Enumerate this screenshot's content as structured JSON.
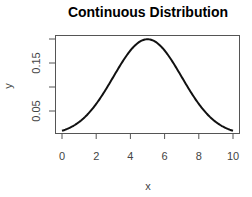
{
  "chart_data": {
    "type": "line",
    "title": "Continuous Distribution",
    "xlabel": "x",
    "ylabel": "y",
    "xlim": [
      0,
      10
    ],
    "ylim": [
      0.0,
      0.2
    ],
    "x_ticks": [
      0,
      2,
      4,
      6,
      8,
      10
    ],
    "x_tick_labels": [
      "0",
      "2",
      "4",
      "6",
      "8",
      "10"
    ],
    "y_ticks": [
      0.05,
      0.1,
      0.15,
      0.2
    ],
    "y_tick_labels": [
      "0.05",
      "",
      "0.15",
      ""
    ],
    "grid": false,
    "legend": null,
    "series": [
      {
        "name": "density",
        "x": [
          0,
          0.5,
          1,
          1.5,
          2,
          2.5,
          3,
          3.5,
          4,
          4.5,
          5,
          5.5,
          6,
          6.5,
          7,
          7.5,
          8,
          8.5,
          9,
          9.5,
          10
        ],
        "y": [
          0.0088,
          0.0158,
          0.027,
          0.0431,
          0.0648,
          0.0913,
          0.121,
          0.1506,
          0.176,
          0.1934,
          0.1995,
          0.1934,
          0.176,
          0.1506,
          0.121,
          0.0913,
          0.0648,
          0.0431,
          0.027,
          0.0158,
          0.0088
        ]
      }
    ]
  }
}
